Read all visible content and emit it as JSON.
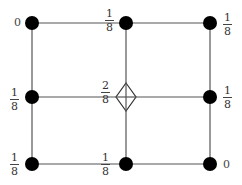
{
  "diagram": {
    "type": "weighted-grid-stencil",
    "nodes": [
      {
        "id": "top-left",
        "label": "0"
      },
      {
        "id": "top-middle",
        "label": {
          "num": "1",
          "den": "8"
        }
      },
      {
        "id": "top-right",
        "label": {
          "num": "1",
          "den": "8"
        }
      },
      {
        "id": "middle-left",
        "label": {
          "num": "1",
          "den": "8"
        }
      },
      {
        "id": "center",
        "label": {
          "num": "2",
          "den": "8"
        },
        "marker": "diamond"
      },
      {
        "id": "middle-right",
        "label": {
          "num": "1",
          "den": "8"
        }
      },
      {
        "id": "bottom-left",
        "label": {
          "num": "1",
          "den": "8"
        }
      },
      {
        "id": "bottom-middle",
        "label": {
          "num": "1",
          "den": "8"
        }
      },
      {
        "id": "bottom-right",
        "label": "0"
      }
    ],
    "colors": {
      "node": "#000000",
      "line": "#555555",
      "text": "#333333"
    }
  }
}
